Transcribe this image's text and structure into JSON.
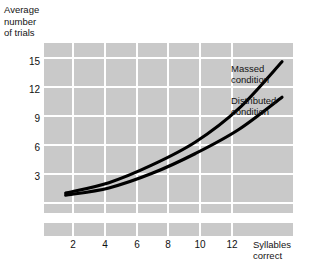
{
  "chart_data": {
    "type": "line",
    "title": "",
    "xlabel": "Syllables correct",
    "ylabel": "Average number of trials",
    "x": [
      2,
      4,
      6,
      8,
      10,
      12
    ],
    "xticklabels": [
      "2",
      "4",
      "6",
      "8",
      "10",
      "12"
    ],
    "yticklabels": [
      "3",
      "6",
      "9",
      "12",
      "15"
    ],
    "yticks": [
      3,
      6,
      9,
      12,
      15
    ],
    "xlim": [
      1,
      12.6
    ],
    "ylim": [
      0,
      16.5
    ],
    "grid": true,
    "grid_style": "shaded-blocks",
    "legend_position": "inline-right-of-curve-ends",
    "series": [
      {
        "name": "Massed condition",
        "label_line1": "Massed",
        "label_line2": "condition",
        "values": [
          2.1,
          3.1,
          4.8,
          7.0,
          10.2,
          14.7
        ],
        "color": "#000000"
      },
      {
        "name": "Distributed condition",
        "label_line1": "Distributed",
        "label_line2": "condition",
        "values": [
          1.9,
          2.6,
          4.0,
          5.9,
          8.2,
          11.3
        ],
        "color": "#000000"
      }
    ]
  },
  "axes": {
    "y_title": "Average\nnumber\nof trials",
    "x_title": "Syllables\ncorrect",
    "y_ticks": [
      {
        "label": "15",
        "top": 57
      },
      {
        "label": "12",
        "top": 85
      },
      {
        "label": "9",
        "top": 114
      },
      {
        "label": "6",
        "top": 143
      },
      {
        "label": "3",
        "top": 172
      }
    ],
    "x_ticks": [
      {
        "label": "2",
        "left": 61
      },
      {
        "label": "4",
        "left": 93
      },
      {
        "label": "6",
        "left": 125
      },
      {
        "label": "8",
        "left": 156
      },
      {
        "label": "10",
        "left": 188
      },
      {
        "label": "12",
        "left": 220
      }
    ]
  },
  "legend": {
    "massed": "Massed\ncondition",
    "distributed": "Distributed\ncondition"
  },
  "colors": {
    "grid_block": "#c9c9c9",
    "background": "#ffffff",
    "line": "#000000",
    "text": "#141414"
  }
}
